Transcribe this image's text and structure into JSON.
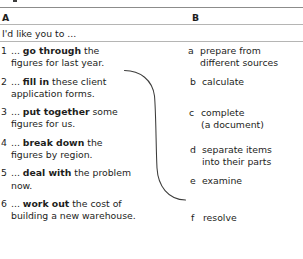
{
  "exercise": {
    "columns": {
      "a_label": "A",
      "b_label": "B"
    },
    "intro": "I'd like you to ...",
    "column_a": [
      {
        "number": "1",
        "line1_pre": "... ",
        "line1_bold": "go through",
        "line1_post": " the",
        "line2": "figures for last year."
      },
      {
        "number": "2",
        "line1_pre": "... ",
        "line1_bold": "fill in",
        "line1_post": " these client",
        "line2": "application forms."
      },
      {
        "number": "3",
        "line1_pre": "... ",
        "line1_bold": "put together",
        "line1_post": " some",
        "line2": "figures for us."
      },
      {
        "number": "4",
        "line1_pre": "... ",
        "line1_bold": "break down",
        "line1_post": " the",
        "line2": "figures by region."
      },
      {
        "number": "5",
        "line1_pre": "... ",
        "line1_bold": "deal with",
        "line1_post": " the problem",
        "line2": "now."
      },
      {
        "number": "6",
        "line1_pre": "... ",
        "line1_bold": "work out",
        "line1_post": " the cost of",
        "line2": "building a new warehouse."
      }
    ],
    "column_b": [
      {
        "letter": "a",
        "line1": "prepare from",
        "line2": "different sources"
      },
      {
        "letter": "b",
        "line1": "calculate",
        "line2": ""
      },
      {
        "letter": "c",
        "line1": "complete",
        "line2": "(a document)"
      },
      {
        "letter": "d",
        "line1": "separate items",
        "line2": "into their parts"
      },
      {
        "letter": "e",
        "line1": "examine",
        "line2": ""
      },
      {
        "letter": "f",
        "line1": "resolve",
        "line2": ""
      }
    ],
    "connector": {
      "from_item": "1",
      "to_item": "e",
      "stroke_color": "#3c3c3b"
    },
    "colors": {
      "text": "#1d1d1b",
      "rule_dark": "#8c8c8b",
      "rule_light": "#b5b5b4",
      "background": "#ffffff"
    }
  }
}
